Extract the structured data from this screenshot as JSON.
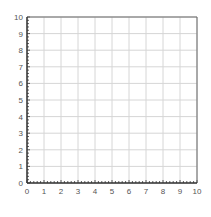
{
  "chart_data": {
    "type": "scatter",
    "title": "",
    "xlabel": "",
    "ylabel": "",
    "xlim": [
      0,
      10
    ],
    "ylim": [
      0,
      10
    ],
    "x_ticks": [
      "0",
      "1",
      "2",
      "3",
      "4",
      "5",
      "6",
      "7",
      "8",
      "9",
      "10"
    ],
    "y_ticks": [
      "0",
      "1",
      "2",
      "3",
      "4",
      "5",
      "6",
      "7",
      "8",
      "9",
      "10"
    ],
    "minor_ticks_per_major": 5,
    "grid": true,
    "series": [],
    "legend": null
  },
  "colors": {
    "axis": "#333333",
    "grid": "#d6d6d6",
    "label": "#555555",
    "background": "#ffffff"
  },
  "layout": {
    "left": 27,
    "right": 197,
    "top": 17,
    "bottom": 183
  }
}
